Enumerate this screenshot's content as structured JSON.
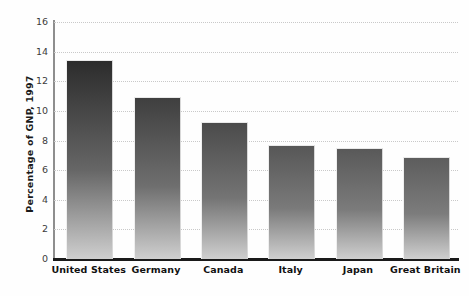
{
  "chart_data": {
    "type": "bar",
    "title": "",
    "xlabel": "",
    "ylabel": "Percentage of GNP, 1997",
    "categories": [
      "United States",
      "Germany",
      "Canada",
      "Italy",
      "Japan",
      "Great Britain"
    ],
    "values": [
      13.4,
      10.9,
      9.2,
      7.6,
      7.4,
      6.8
    ],
    "ylim": [
      0,
      16
    ],
    "ytick_labels": [
      "0",
      "2",
      "4",
      "6",
      "8",
      "10",
      "12",
      "14",
      "16"
    ],
    "ytick_values": [
      0,
      2,
      4,
      6,
      8,
      10,
      12,
      14,
      16
    ],
    "grid": true,
    "legend": "none",
    "series": [
      {
        "name": "Percentage of GNP, 1997",
        "values": [
          13.4,
          10.9,
          9.2,
          7.6,
          7.4,
          6.8
        ]
      }
    ],
    "colors": {
      "bar_top_dark": "#2f2f2f",
      "bar_bottom_light": "#cfcfcf",
      "gridline": "#c9c9c9",
      "axis": "#1a1a1a",
      "text": "#111111"
    }
  }
}
